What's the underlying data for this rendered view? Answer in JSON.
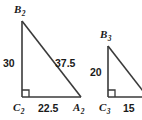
{
  "figure": {
    "background_color": "#ffffff",
    "stroke_color": "#3a3a3a",
    "text_color": "#1a1a1a"
  },
  "triangles": [
    {
      "id": "triangle-2",
      "clipped": false,
      "vertices": {
        "apex": {
          "label": "B",
          "subscript": "2"
        },
        "right_angle": {
          "label": "C",
          "subscript": "2"
        },
        "base_right": {
          "label": "A",
          "subscript": "2"
        }
      },
      "sides": {
        "vertical_leg": "30",
        "base": "22.5",
        "hypotenuse": "37.5"
      },
      "right_angle_at": "C2"
    },
    {
      "id": "triangle-3",
      "clipped": true,
      "vertices": {
        "apex": {
          "label": "B",
          "subscript": "3"
        },
        "right_angle": {
          "label": "C",
          "subscript": "3"
        }
      },
      "sides": {
        "vertical_leg": "20",
        "base": "15"
      },
      "right_angle_at": "C3"
    }
  ]
}
